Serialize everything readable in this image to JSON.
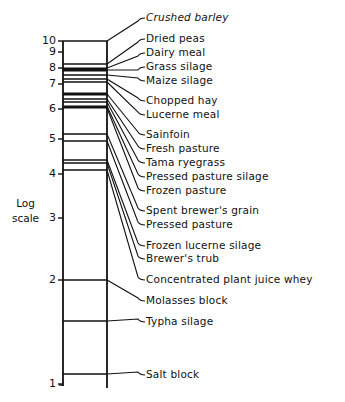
{
  "axis": {
    "title_line1": "Log",
    "title_line2": "scale",
    "ticks": [
      {
        "label": "10",
        "y": 41
      },
      {
        "label": "9",
        "y": 52
      },
      {
        "label": "8",
        "y": 68
      },
      {
        "label": "7",
        "y": 84
      },
      {
        "label": "6",
        "y": 109
      },
      {
        "label": "5",
        "y": 139
      },
      {
        "label": "4",
        "y": 174
      },
      {
        "label": "3",
        "y": 218
      },
      {
        "label": "2",
        "y": 280
      },
      {
        "label": "1",
        "y": 384
      }
    ]
  },
  "labels": [
    {
      "text": "Crushed barley",
      "italic": true,
      "label_y": 17,
      "bar_y": 41
    },
    {
      "text": "Dried peas",
      "italic": false,
      "label_y": 38,
      "bar_y": 64
    },
    {
      "text": "Dairy meal",
      "italic": false,
      "label_y": 52,
      "bar_y": 68
    },
    {
      "text": "Grass silage",
      "italic": false,
      "label_y": 66,
      "bar_y": 70
    },
    {
      "text": "Maize silage",
      "italic": false,
      "label_y": 80,
      "bar_y": 75
    },
    {
      "text": "Chopped hay",
      "italic": false,
      "label_y": 100,
      "bar_y": 79
    },
    {
      "text": "Lucerne meal",
      "italic": false,
      "label_y": 114,
      "bar_y": 82
    },
    {
      "text": "Sainfoin",
      "italic": false,
      "label_y": 134,
      "bar_y": 94
    },
    {
      "text": "Fresh pasture",
      "italic": false,
      "label_y": 148,
      "bar_y": 99
    },
    {
      "text": "Tama ryegrass",
      "italic": false,
      "label_y": 162,
      "bar_y": 102
    },
    {
      "text": "Pressed pasture silage",
      "italic": false,
      "label_y": 176,
      "bar_y": 106
    },
    {
      "text": "Frozen pasture",
      "italic": false,
      "label_y": 190,
      "bar_y": 108
    },
    {
      "text": "Spent brewer's grain",
      "italic": false,
      "label_y": 210,
      "bar_y": 134
    },
    {
      "text": "Pressed pasture",
      "italic": false,
      "label_y": 224,
      "bar_y": 141
    },
    {
      "text": "Frozen lucerne silage",
      "italic": false,
      "label_y": 245,
      "bar_y": 160
    },
    {
      "text": "Brewer's trub",
      "italic": false,
      "label_y": 258,
      "bar_y": 163
    },
    {
      "text": "Concentrated plant juice whey",
      "italic": false,
      "label_y": 279,
      "bar_y": 170
    },
    {
      "text": "Molasses block",
      "italic": false,
      "label_y": 300,
      "bar_y": 280
    },
    {
      "text": "Typha silage",
      "italic": false,
      "label_y": 321,
      "bar_y": 321
    },
    {
      "text": "Salt block",
      "italic": false,
      "label_y": 374,
      "bar_y": 374
    }
  ],
  "bar_lines": [
    {
      "y": 41,
      "w": 1.6
    },
    {
      "y": 64,
      "w": 1.4
    },
    {
      "y": 69.5,
      "w": 4
    },
    {
      "y": 75,
      "w": 1.4
    },
    {
      "y": 79,
      "w": 1.4
    },
    {
      "y": 82,
      "w": 1.4
    },
    {
      "y": 94,
      "w": 3
    },
    {
      "y": 99,
      "w": 1.4
    },
    {
      "y": 102,
      "w": 1.4
    },
    {
      "y": 107,
      "w": 3
    },
    {
      "y": 134,
      "w": 1.4
    },
    {
      "y": 141,
      "w": 1.4
    },
    {
      "y": 160,
      "w": 1.6
    },
    {
      "y": 163,
      "w": 1.6
    },
    {
      "y": 170,
      "w": 1.4
    },
    {
      "y": 280,
      "w": 1.4
    },
    {
      "y": 321,
      "w": 1.4
    },
    {
      "y": 374,
      "w": 1.4
    }
  ],
  "colors": {
    "ink": "#111111",
    "background": "#ffffff"
  }
}
